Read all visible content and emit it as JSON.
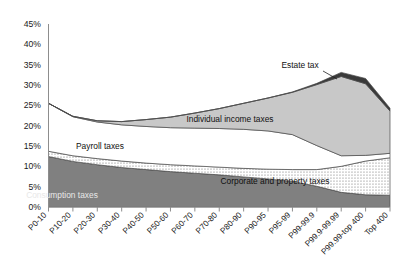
{
  "chart_data": {
    "type": "area",
    "title": "",
    "subtitle": "",
    "xlabel": "",
    "ylabel": "",
    "stacked": true,
    "grid": false,
    "legend_position": "inline-labels",
    "ylim": [
      0,
      45
    ],
    "ytick_labels": [
      "0%",
      "5%",
      "10%",
      "15%",
      "20%",
      "25%",
      "30%",
      "35%",
      "40%",
      "45%"
    ],
    "ytick_values": [
      0,
      5,
      10,
      15,
      20,
      25,
      30,
      35,
      40,
      45
    ],
    "categories": [
      "P0-10",
      "P10-20",
      "P20-30",
      "P30-40",
      "P40-50",
      "P50-60",
      "P60-70",
      "P70-80",
      "P80-90",
      "P90-95",
      "P95-99",
      "P99-99.9",
      "P99.9-99.99",
      "P99.99-top 400",
      "Top 400"
    ],
    "series": [
      {
        "name": "Consumption taxes",
        "fill": "#808080",
        "pattern": "solid",
        "values": [
          12.4,
          11.2,
          10.4,
          9.7,
          9.2,
          8.7,
          8.3,
          7.9,
          7.4,
          6.9,
          6.3,
          5.1,
          3.6,
          3.0,
          2.9
        ]
      },
      {
        "name": "Corporate and property taxes",
        "fill": "#ffffff",
        "pattern": "dots",
        "values": [
          1.3,
          1.4,
          1.5,
          1.6,
          1.6,
          1.7,
          1.8,
          1.9,
          2.1,
          2.4,
          2.9,
          4.1,
          6.4,
          8.3,
          9.2
        ]
      },
      {
        "name": "Payroll taxes",
        "fill": "#ffffff",
        "pattern": "plain",
        "values": [
          11.8,
          9.6,
          9.0,
          8.9,
          9.0,
          9.1,
          9.3,
          9.5,
          9.6,
          9.4,
          8.6,
          5.9,
          2.6,
          1.4,
          1.1
        ]
      },
      {
        "name": "Individual income taxes",
        "fill": "#c8c8c8",
        "pattern": "solid",
        "values": [
          0.0,
          0.1,
          0.3,
          0.8,
          1.7,
          2.6,
          3.7,
          4.9,
          6.4,
          8.1,
          10.4,
          15.0,
          19.5,
          17.6,
          10.4
        ]
      },
      {
        "name": "Estate tax",
        "fill": "#3a3a3a",
        "pattern": "solid",
        "values": [
          0.0,
          0.0,
          0.0,
          0.0,
          0.0,
          0.0,
          0.0,
          0.0,
          0.0,
          0.0,
          0.1,
          0.3,
          1.0,
          1.3,
          0.7
        ]
      }
    ],
    "totals": [
      25.5,
      22.3,
      21.2,
      21.0,
      21.5,
      22.1,
      23.1,
      24.2,
      25.5,
      26.8,
      28.3,
      30.4,
      33.1,
      31.6,
      24.3
    ],
    "annotations": [
      {
        "text": "Estate tax",
        "x_px": 300,
        "y_px": 68
      },
      {
        "text": "Individual income taxes",
        "x_px": 230,
        "y_px": 122
      },
      {
        "text": "Payroll taxes",
        "x_px": 100,
        "y_px": 149
      },
      {
        "text": "Corporate and property taxes",
        "x_px": 275,
        "y_px": 184
      },
      {
        "text": "Consumption taxes",
        "x_px": 62,
        "y_px": 198
      }
    ]
  }
}
